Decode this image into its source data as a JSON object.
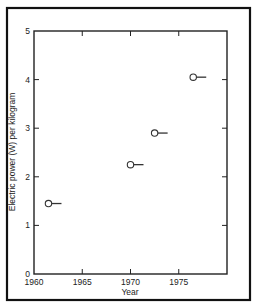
{
  "chart_data": {
    "type": "scatter",
    "title": "",
    "xlabel": "Year",
    "ylabel": "Electric power (W) per kilogram",
    "xlim": [
      1960,
      1980
    ],
    "ylim": [
      0,
      5
    ],
    "x_ticks": [
      1960,
      1965,
      1970,
      1975
    ],
    "x_tick_labels": [
      "1960",
      "1965",
      "1970",
      "1975"
    ],
    "y_ticks": [
      0,
      1,
      2,
      3,
      4,
      5
    ],
    "y_tick_labels": [
      "0",
      "1",
      "2",
      "3",
      "4",
      "5"
    ],
    "grid": false,
    "legend": null,
    "marker": "open-circle-with-right-arrow-line",
    "series": [
      {
        "name": "Electric power per kilogram",
        "x": [
          1961.5,
          1970,
          1972.5,
          1976.5
        ],
        "y": [
          1.45,
          2.25,
          2.9,
          4.05
        ]
      }
    ]
  },
  "colors": {
    "frame": "#111111",
    "axis": "#222222",
    "marker": "#333333",
    "background": "#ffffff"
  }
}
